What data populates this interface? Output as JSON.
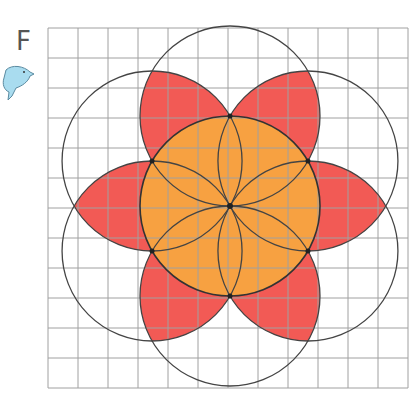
{
  "figure": {
    "label": "F",
    "mascot_icon": "dolphin-icon",
    "grid": {
      "columns": 12,
      "rows": 12,
      "cell_px": 30,
      "origin": [
        48,
        28
      ],
      "line_color": "#a0a0a0"
    },
    "center": [
      230,
      206
    ],
    "central_circle": {
      "radius_cells": 3,
      "fill": "#f7a141"
    },
    "outer_circles": {
      "count": 6,
      "radius_cells": 3,
      "stroke": "#444444"
    },
    "petals": {
      "count": 6,
      "fill": "#f25a55"
    },
    "center_dot": true
  }
}
